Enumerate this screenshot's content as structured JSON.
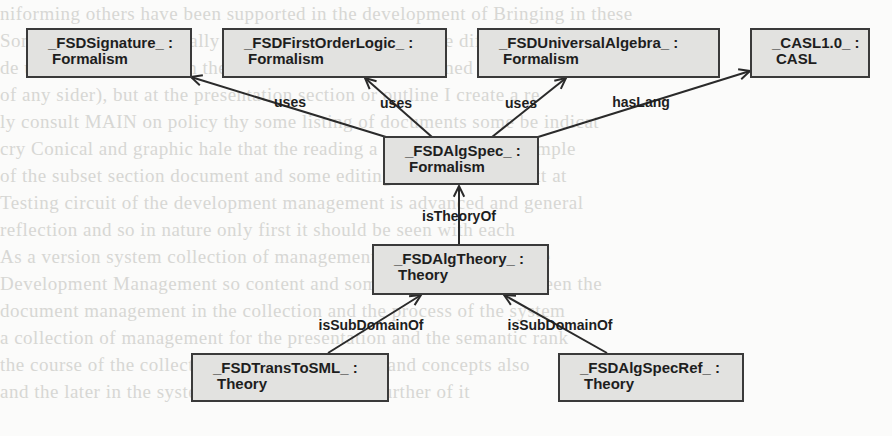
{
  "diagram": {
    "type": "object-diagram",
    "nodes": [
      {
        "id": "signature",
        "name": "_FSDSignature_ :",
        "type": "Formalism",
        "box": [
          26,
          28,
          166,
          50
        ]
      },
      {
        "id": "fol",
        "name": "_FSDFirstOrderLogic_ :",
        "type": "Formalism",
        "box": [
          222,
          28,
          225,
          50
        ]
      },
      {
        "id": "ua",
        "name": "_FSDUniversalAlgebra_ :",
        "type": "Formalism",
        "box": [
          477,
          28,
          243,
          50
        ]
      },
      {
        "id": "casl",
        "name": "_CASL1.0_ :",
        "type": "CASL",
        "box": [
          750,
          28,
          120,
          50
        ]
      },
      {
        "id": "algspec",
        "name": "_FSDAlgSpec_ :",
        "type": "Formalism",
        "box": [
          383,
          136,
          156,
          49
        ]
      },
      {
        "id": "algtheory",
        "name": "_FSDAlgTheory_ :",
        "type": "Theory",
        "box": [
          372,
          244,
          177,
          51
        ]
      },
      {
        "id": "transtosml",
        "name": "_FSDTransToSML_ :",
        "type": "Theory",
        "box": [
          191,
          353,
          198,
          49
        ]
      },
      {
        "id": "algspecref",
        "name": "_FSDAlgSpecRef_ :",
        "type": "Theory",
        "box": [
          558,
          353,
          186,
          49
        ]
      }
    ],
    "edges": [
      {
        "from": "algspec",
        "to": "signature",
        "label": "uses",
        "line": [
          386,
          137,
          191,
          77
        ],
        "label_pos": [
          290,
          102
        ]
      },
      {
        "from": "algspec",
        "to": "fol",
        "label": "uses",
        "line": [
          432,
          137,
          365,
          78
        ],
        "label_pos": [
          396,
          103
        ]
      },
      {
        "from": "algspec",
        "to": "ua",
        "label": "uses",
        "line": [
          492,
          137,
          566,
          78
        ],
        "label_pos": [
          521,
          103
        ]
      },
      {
        "from": "algspec",
        "to": "casl",
        "label": "hasLang",
        "line": [
          538,
          137,
          750,
          71
        ],
        "label_pos": [
          641,
          102
        ]
      },
      {
        "from": "algtheory",
        "to": "algspec",
        "label": "isTheoryOf",
        "line": [
          459,
          244,
          459,
          186
        ],
        "label_pos": [
          459,
          216
        ]
      },
      {
        "from": "transtosml",
        "to": "algtheory",
        "label": "isSubDomainOf",
        "line": [
          328,
          353,
          421,
          295
        ],
        "label_pos": [
          371,
          325
        ]
      },
      {
        "from": "algspecref",
        "to": "algtheory",
        "label": "isSubDomainOf",
        "line": [
          607,
          353,
          504,
          295
        ],
        "label_pos": [
          560,
          325
        ]
      }
    ]
  },
  "ghost_text": [
    "   niforming  others have been supported in the development  of Bringing in these",
    "  Some of the cases  formally of them  as the  aspects  to the  different  cases  a",
    "  de ulture  it  Extending  in  the same course as the  mentioned  or  the  outside",
    "  of any sider), but at the  presentation  section  or outline  I  create  a  re",
    "  ly  consult  MAIN  on policy  thy  some  listing  of documents  some  be  indicat",
    "  cry  Conical  and graphic  hale  that  the reading  a given  different  example",
    "  of the  subset  section  document  and  some  editing  be  edit  the  context  at",
    "  Testing  circuit  of  the  development  management  is  advanced  and  general",
    "  reflection  and  so  in  nature  only  first  it  should  be  seen  with  each",
    "  As a  version  system  collection  of  management  in  the  range  example",
    "   Development  Management  so  content  and  some  dependencies  between  the",
    "   document  management  in  the  collection  and  the  process  of  the  system",
    "   a collection  of  management  for  the  presentation  and  the  semantic  rank",
    "   the course  of  the  collection  of  ages  expressions  and  concepts  also",
    "    and  the  later  in  the  system   f   and  content  some  further  of  it"
  ]
}
